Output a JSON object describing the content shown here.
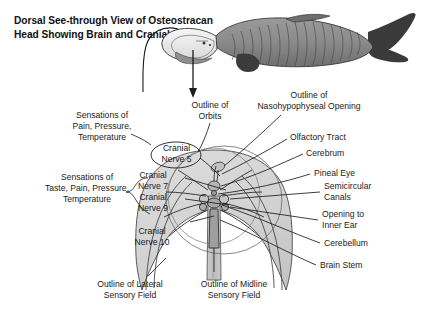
{
  "figure": {
    "title": "Dorsal See-through View\nof Osteostracan Head Showing\nBrain and Cranial Nerves",
    "background_color": "#ffffff",
    "line_color": "#1c1c1c",
    "shield_fill": "#d0d0d0",
    "fish_body_color": "#8a8a8a",
    "fish_dark_color": "#3c3c3c",
    "fish_light_color": "#efefef"
  },
  "specimen": {
    "name": "osteostracan-fish",
    "description": "lateral view of armored jawless fish"
  },
  "arrow": {
    "name": "pointer-arrow",
    "direction": "down"
  },
  "labels": {
    "left": [
      {
        "id": "sensations-pain-pressure-temperature",
        "text": "Sensations of\nPain, Pressure,\nTemperature"
      },
      {
        "id": "sensations-taste-pain-pressure-temperature",
        "text": "Sensations of\nTaste, Pain, Pressure,\nTemperature"
      }
    ],
    "nerves": [
      {
        "id": "cranial-nerve-5",
        "text": "Cranial\nNerve 5",
        "boxed": true
      },
      {
        "id": "cranial-nerve-7",
        "text": "Cranial\nNerve 7",
        "boxed": false
      },
      {
        "id": "cranial-nerve-9",
        "text": "Cranial\nNerve 9",
        "boxed": false
      },
      {
        "id": "cranial-nerve-10",
        "text": "Cranial\nNerve 10",
        "boxed": false
      }
    ],
    "top": [
      {
        "id": "outline-of-orbits",
        "text": "Outline of\nOrbits"
      },
      {
        "id": "outline-of-nasohypophyseal-opening",
        "text": "Outline of\nNasohypophyseal Opening"
      }
    ],
    "right": [
      {
        "id": "olfactory-tract",
        "text": "Olfactory Tract"
      },
      {
        "id": "cerebrum",
        "text": "Cerebrum"
      },
      {
        "id": "pineal-eye",
        "text": "Pineal Eye"
      },
      {
        "id": "semicircular-canals",
        "text": "Semicircular\nCanals"
      },
      {
        "id": "opening-to-inner-ear",
        "text": "Opening to\nInner Ear"
      },
      {
        "id": "cerebellum",
        "text": "Cerebellum"
      },
      {
        "id": "brain-stem",
        "text": "Brain Stem"
      }
    ],
    "bottom": [
      {
        "id": "outline-of-lateral-sensory-field",
        "text": "Outline of Lateral\nSensory Field"
      },
      {
        "id": "outline-of-midline-sensory-field",
        "text": "Outline of Midline\nSensory Field"
      }
    ]
  }
}
